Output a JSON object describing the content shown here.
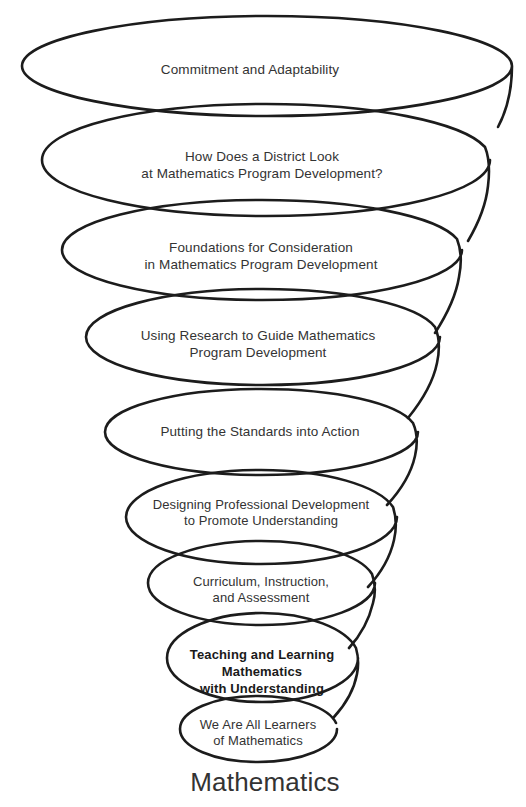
{
  "figure": {
    "background_color": "#ffffff",
    "stroke_color": "#1c1c1c",
    "text_color": "#333333",
    "base_caption": "Mathematics"
  },
  "loops": [
    {
      "index": 1,
      "label": "Commitment and Adaptability",
      "lines": [
        "Commitment and Adaptability"
      ],
      "bold": false,
      "font_size": 13.5,
      "center_x": 250,
      "center_y": 69,
      "ellipse": {
        "cx": 267,
        "cy": 63,
        "rx": 245,
        "ry": 50
      }
    },
    {
      "index": 2,
      "label": "How Does a District Look at Mathematics Program Development?",
      "lines": [
        "How Does a District Look",
        "at Mathematics Program Development?"
      ],
      "bold": false,
      "font_size": 13.5,
      "center_x": 262,
      "center_y": 165,
      "ellipse": {
        "cx": 266,
        "cy": 157,
        "rx": 224,
        "ry": 59
      }
    },
    {
      "index": 3,
      "label": "Foundations for Consideration in Mathematics Program Development",
      "lines": [
        "Foundations for Consideration",
        "in Mathematics Program Development"
      ],
      "bold": false,
      "font_size": 13.5,
      "center_x": 261,
      "center_y": 256,
      "ellipse": {
        "cx": 262,
        "cy": 249,
        "rx": 200,
        "ry": 51
      }
    },
    {
      "index": 4,
      "label": "Using Research to Guide Mathematics Program Development",
      "lines": [
        "Using Research to Guide Mathematics",
        "Program Development"
      ],
      "bold": false,
      "font_size": 13.5,
      "center_x": 258,
      "center_y": 344,
      "ellipse": {
        "cx": 262,
        "cy": 337,
        "rx": 177,
        "ry": 48
      }
    },
    {
      "index": 5,
      "label": "Putting the Standards into Action",
      "lines": [
        "Putting the Standards into Action"
      ],
      "bold": false,
      "font_size": 13.5,
      "center_x": 260,
      "center_y": 431,
      "ellipse": {
        "cx": 261,
        "cy": 432,
        "rx": 157,
        "ry": 43
      }
    },
    {
      "index": 6,
      "label": "Designing Professional Development to Promote Understanding",
      "lines": [
        "Designing Professional Development",
        "to Promote Understanding"
      ],
      "bold": false,
      "font_size": 13,
      "center_x": 261,
      "center_y": 513,
      "ellipse": {
        "cx": 261,
        "cy": 517,
        "rx": 136,
        "ry": 47
      }
    },
    {
      "index": 7,
      "label": "Curriculum, Instruction, and Assessment",
      "lines": [
        "Curriculum, Instruction,",
        "and Assessment"
      ],
      "bold": false,
      "font_size": 13,
      "center_x": 261,
      "center_y": 590,
      "ellipse": {
        "cx": 261,
        "cy": 583,
        "rx": 114,
        "ry": 43
      }
    },
    {
      "index": 8,
      "label": "Teaching and Learning Mathematics with Understanding",
      "lines": [
        "Teaching and Learning",
        "Mathematics",
        "with Understanding"
      ],
      "bold": true,
      "font_size": 13,
      "center_x": 262,
      "center_y": 672,
      "ellipse": {
        "cx": 262,
        "cy": 658,
        "rx": 96,
        "ry": 45
      }
    },
    {
      "index": 9,
      "label": "We Are All Learners of Mathematics",
      "lines": [
        "We Are All Learners",
        "of Mathematics"
      ],
      "bold": false,
      "font_size": 13,
      "center_x": 258,
      "center_y": 733,
      "ellipse": {
        "cx": 258,
        "cy": 729,
        "rx": 79,
        "ry": 33
      }
    }
  ],
  "caption": {
    "text": "Mathematics",
    "center_x": 265,
    "center_y": 782,
    "font_size": 26
  }
}
